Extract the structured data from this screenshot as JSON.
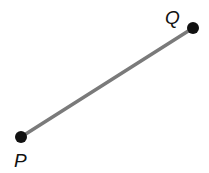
{
  "figure": {
    "type": "geometry-line-segment",
    "background_color": "#ffffff",
    "width": 209,
    "height": 173,
    "segment": {
      "name": "segment-PQ",
      "stroke_color": "#7a7a7a",
      "stroke_width": 3.5,
      "from": {
        "x": 21,
        "y": 137
      },
      "to": {
        "x": 193,
        "y": 28
      }
    },
    "points": [
      {
        "id": "P",
        "label": "P",
        "x": 21,
        "y": 137,
        "radius": 6,
        "color": "#111111",
        "label_x": 14,
        "label_y": 151
      },
      {
        "id": "Q",
        "label": "Q",
        "x": 193,
        "y": 28,
        "radius": 6,
        "color": "#111111",
        "label_x": 165,
        "label_y": 8
      }
    ]
  }
}
